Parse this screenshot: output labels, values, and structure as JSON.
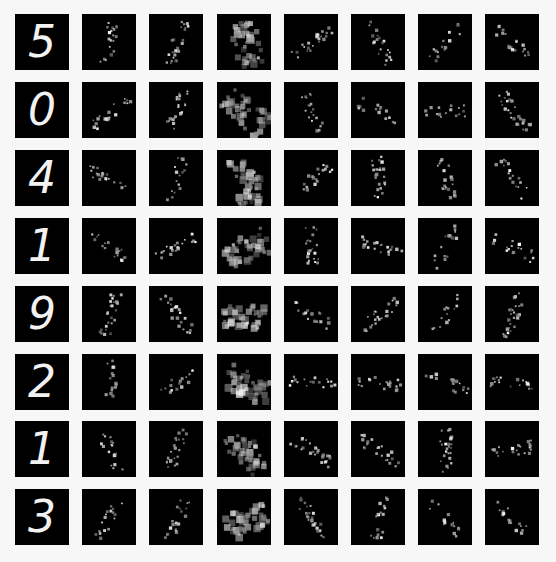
{
  "figure": {
    "rows": 8,
    "cols": 8,
    "background": "#f7f7f7",
    "tile_color": "#000000",
    "activation_color": "#ffffff"
  },
  "digits": [
    {
      "label": "5",
      "feature_maps": 7
    },
    {
      "label": "0",
      "feature_maps": 7
    },
    {
      "label": "4",
      "feature_maps": 7
    },
    {
      "label": "1",
      "feature_maps": 7
    },
    {
      "label": "9",
      "feature_maps": 7
    },
    {
      "label": "2",
      "feature_maps": 7
    },
    {
      "label": "1",
      "feature_maps": 7
    },
    {
      "label": "3",
      "feature_maps": 7
    }
  ]
}
